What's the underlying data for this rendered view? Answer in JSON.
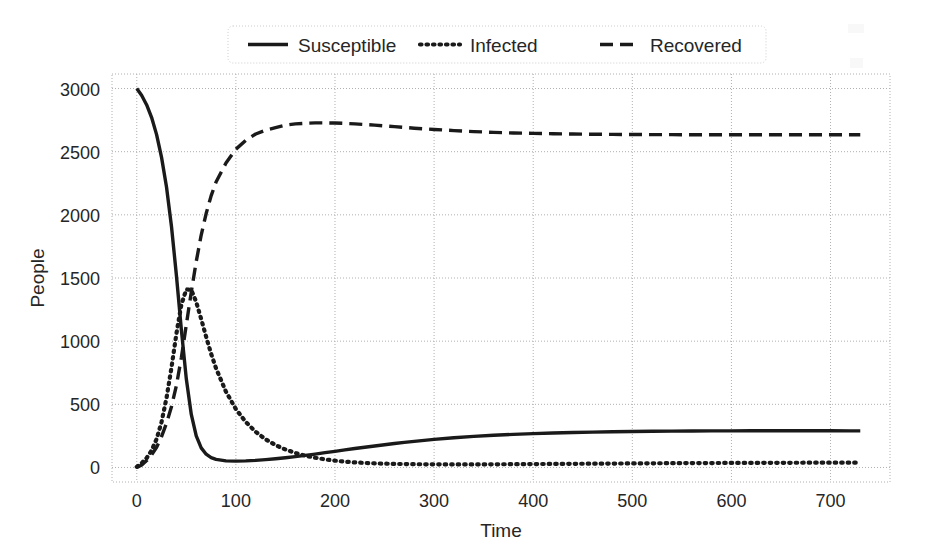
{
  "chart_data": {
    "type": "line",
    "title": "",
    "xlabel": "Time",
    "ylabel": "People",
    "xlim": [
      -25,
      760
    ],
    "ylim": [
      -115,
      3115
    ],
    "xticks": [
      0,
      100,
      200,
      300,
      400,
      500,
      600,
      700
    ],
    "xticklabels": [
      "0",
      "100",
      "200",
      "300",
      "400",
      "500",
      "600",
      "700"
    ],
    "yticks": [
      0,
      500,
      1000,
      1500,
      2000,
      2500,
      3000
    ],
    "yticklabels": [
      "0",
      "500",
      "1000",
      "1500",
      "2000",
      "2500",
      "3000"
    ],
    "grid": true,
    "grid_style": "dotted",
    "grid_color": "#b0b0b0",
    "legend_position": "upper center",
    "line_color": "#1a1a1a",
    "x": [
      0,
      5,
      10,
      15,
      20,
      25,
      30,
      35,
      40,
      45,
      50,
      55,
      60,
      65,
      70,
      75,
      80,
      90,
      100,
      110,
      120,
      130,
      140,
      150,
      160,
      170,
      180,
      190,
      200,
      210,
      220,
      230,
      240,
      250,
      260,
      270,
      280,
      290,
      300,
      320,
      340,
      360,
      380,
      400,
      420,
      440,
      460,
      480,
      500,
      520,
      540,
      560,
      580,
      600,
      620,
      640,
      660,
      680,
      700,
      720,
      730
    ],
    "series": [
      {
        "name": "Susceptible",
        "style": "solid",
        "values": [
          3000,
          2945,
          2870,
          2770,
          2635,
          2455,
          2220,
          1910,
          1520,
          1090,
          700,
          420,
          250,
          155,
          105,
          78,
          64,
          52,
          50,
          52,
          56,
          62,
          69,
          77,
          86,
          96,
          106,
          117,
          128,
          139,
          150,
          160,
          170,
          180,
          190,
          199,
          207,
          215,
          222,
          235,
          246,
          255,
          262,
          268,
          273,
          277,
          280,
          283,
          285,
          287,
          288,
          289,
          290,
          290,
          291,
          291,
          291,
          291,
          291,
          290,
          290
        ]
      },
      {
        "name": "Infected",
        "style": "dotted",
        "values": [
          5,
          35,
          75,
          135,
          225,
          360,
          550,
          790,
          1060,
          1290,
          1410,
          1405,
          1310,
          1175,
          1035,
          900,
          785,
          600,
          462,
          360,
          282,
          223,
          177,
          142,
          115,
          93,
          77,
          64,
          54,
          46,
          40,
          36,
          33,
          30,
          28,
          27,
          26,
          25,
          25,
          24,
          24,
          25,
          26,
          27,
          28,
          29,
          30,
          31,
          32,
          33,
          34,
          35,
          35,
          36,
          36,
          37,
          37,
          38,
          38,
          38,
          38
        ]
      },
      {
        "name": "Recovered",
        "style": "dashed",
        "values": [
          0,
          20,
          55,
          100,
          160,
          245,
          350,
          480,
          650,
          870,
          1130,
          1390,
          1630,
          1840,
          2010,
          2150,
          2260,
          2410,
          2520,
          2590,
          2640,
          2670,
          2690,
          2710,
          2720,
          2725,
          2728,
          2728,
          2727,
          2724,
          2720,
          2715,
          2710,
          2704,
          2698,
          2692,
          2686,
          2681,
          2676,
          2667,
          2659,
          2653,
          2648,
          2645,
          2642,
          2640,
          2638,
          2637,
          2636,
          2635,
          2635,
          2634,
          2634,
          2634,
          2634,
          2634,
          2634,
          2634,
          2634,
          2634,
          2634
        ]
      }
    ],
    "legend": [
      {
        "label": "Susceptible",
        "style": "solid"
      },
      {
        "label": "Infected",
        "style": "dotted"
      },
      {
        "label": "Recovered",
        "style": "dashed"
      }
    ]
  }
}
